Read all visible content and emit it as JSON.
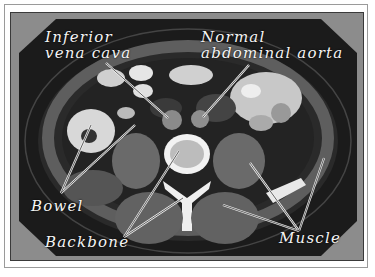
{
  "figure": {
    "labels": {
      "ivc_line1": "Inferior",
      "ivc_line2": "vena cava",
      "aorta_line1": "Normal",
      "aorta_line2": "abdominal aorta",
      "bowel": "Bowel",
      "backbone": "Backbone",
      "muscle": "Muscle"
    },
    "colors": {
      "background": "#8c8c8c",
      "scan_field": "#1c1c1c",
      "label_text": "#f4f4f4"
    }
  }
}
